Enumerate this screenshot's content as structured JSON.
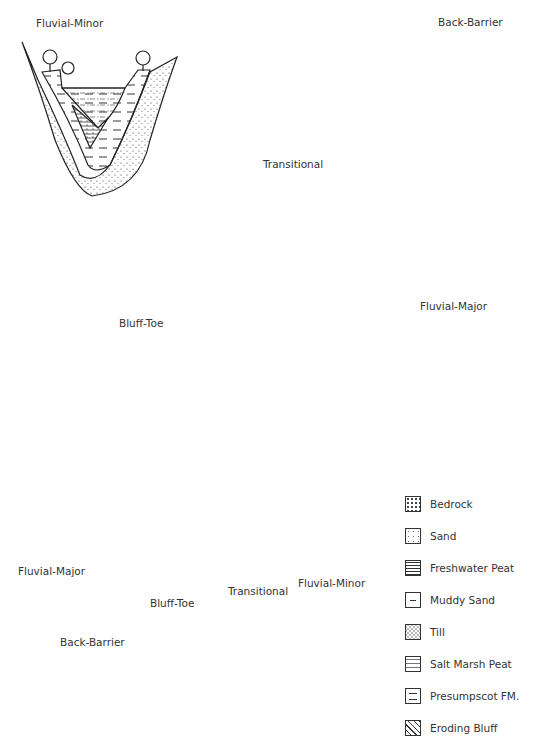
{
  "panels": {
    "fluvial_minor": {
      "title": "Fluvial-Minor"
    },
    "back_barrier": {
      "title": "Back-Barrier"
    },
    "transitional": {
      "title": "Transitional"
    },
    "fluvial_major": {
      "title": "Fluvial-Major"
    },
    "bluff_toe": {
      "title": "Bluff-Toe"
    }
  },
  "map": {
    "labels": {
      "fluvial_major": "Fluvial-Major",
      "back_barrier": "Back-Barrier",
      "bluff_toe": "Bluff-Toe",
      "transitional": "Transitional",
      "fluvial_minor": "Fluvial-Minor"
    }
  },
  "legend": {
    "items": [
      {
        "label": "Bedrock",
        "pattern": "bedrock"
      },
      {
        "label": "Sand",
        "pattern": "sand"
      },
      {
        "label": "Freshwater Peat",
        "pattern": "freshwater-peat"
      },
      {
        "label": "Muddy Sand",
        "pattern": "muddy-sand"
      },
      {
        "label": "Till",
        "pattern": "till"
      },
      {
        "label": "Salt Marsh Peat",
        "pattern": "salt-marsh-peat"
      },
      {
        "label": "Presumpscot FM.",
        "pattern": "presumpscot"
      },
      {
        "label": "Eroding Bluff",
        "pattern": "eroding-bluff"
      }
    ]
  }
}
